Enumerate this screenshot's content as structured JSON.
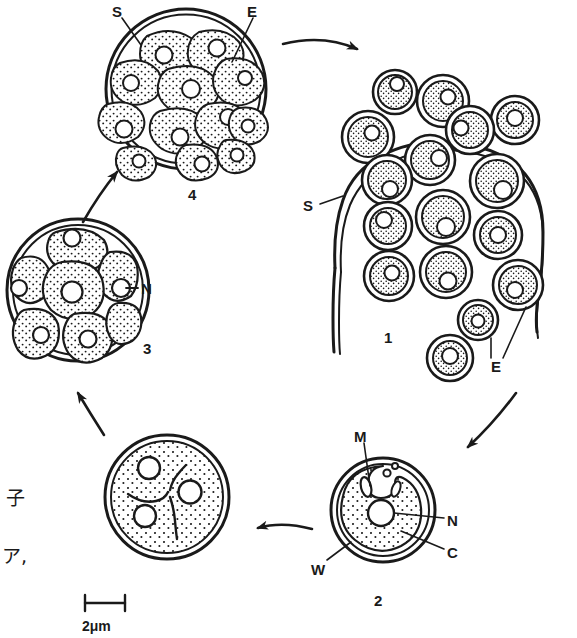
{
  "figure": {
    "scale_bar": {
      "value": "2",
      "unit": "μm",
      "label": "2μm",
      "length_px": 40
    },
    "stroke_color": "#1a1a1a",
    "fill_color": "#ffffff",
    "stipple_color": "#1a1a1a"
  },
  "margin_text": [
    {
      "text": "子",
      "x": 6,
      "y": 489
    },
    {
      "text": "ア,",
      "x": 2,
      "y": 547
    }
  ],
  "stage_numbers": [
    {
      "text": "1",
      "x": 384,
      "y": 330
    },
    {
      "text": "2",
      "x": 374,
      "y": 593
    },
    {
      "text": "3",
      "x": 143,
      "y": 341
    },
    {
      "text": "4",
      "x": 188,
      "y": 187
    }
  ],
  "labels": [
    {
      "key": "S",
      "text": "S",
      "x": 112,
      "y": 4,
      "stage": "4",
      "meaning": "sporangium wall"
    },
    {
      "key": "E",
      "text": "E",
      "x": 247,
      "y": 4,
      "stage": "4",
      "meaning": "endospore"
    },
    {
      "key": "S",
      "text": "S",
      "x": 303,
      "y": 198,
      "stage": "1",
      "meaning": "sporangium wall"
    },
    {
      "key": "E",
      "text": "E",
      "x": 491,
      "y": 359,
      "stage": "1",
      "meaning": "endospore"
    },
    {
      "key": "M",
      "text": "M",
      "x": 354,
      "y": 429,
      "stage": "2",
      "meaning": "mitochondrion"
    },
    {
      "key": "N",
      "text": "N",
      "x": 447,
      "y": 513,
      "stage": "2",
      "meaning": "nucleus"
    },
    {
      "key": "C",
      "text": "C",
      "x": 447,
      "y": 545,
      "stage": "2",
      "meaning": "cytoplasm"
    },
    {
      "key": "W",
      "text": "W",
      "x": 311,
      "y": 562,
      "stage": "2",
      "meaning": "cell wall"
    },
    {
      "key": "N",
      "text": "N",
      "x": 141,
      "y": 281,
      "stage": "3",
      "meaning": "nucleus"
    }
  ],
  "stages": [
    {
      "id": "4",
      "caption": "4",
      "description": "Mature sporangium: double outer wall enclosing about twelve stippled endospores, each with a clear nucleus.",
      "endospore_count": 12
    },
    {
      "id": "1",
      "caption": "1",
      "description": "Ruptured sporangium wall releasing free endospores.",
      "endospore_count": 16
    },
    {
      "id": "2",
      "caption": "2",
      "description": "Single released endospore / vegetative cell showing wall, cytoplasm, nucleus and mitochondria.",
      "endospore_count": 1
    },
    {
      "id": "cleavage",
      "caption": "",
      "description": "Multinucleate cell with three nuclei and incipient Y-shaped cleavage furrows.",
      "nuclei_count": 3
    },
    {
      "id": "3",
      "caption": "3",
      "description": "Cell divided into about seven daughter cells by septa, each with a nucleus.",
      "cell_count": 7
    }
  ],
  "arrows": [
    {
      "from": "4",
      "to": "1",
      "direction": "right",
      "name": "arrow-4-to-1"
    },
    {
      "from": "1",
      "to": "2",
      "direction": "down-left",
      "name": "arrow-1-to-2"
    },
    {
      "from": "2",
      "to": "cleavage",
      "direction": "left",
      "name": "arrow-2-to-cleavage"
    },
    {
      "from": "cleavage",
      "to": "3",
      "direction": "up",
      "name": "arrow-cleavage-to-3"
    },
    {
      "from": "3",
      "to": "4",
      "direction": "up-right",
      "name": "arrow-3-to-4"
    }
  ]
}
